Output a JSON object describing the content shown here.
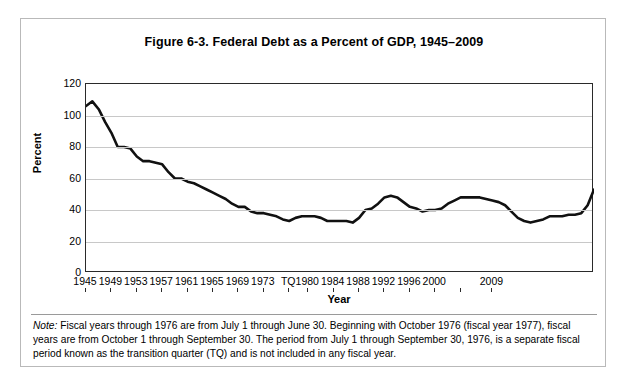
{
  "figure": {
    "title": "Figure 6-3. Federal Debt as a Percent of GDP, 1945–2009",
    "note_label": "Note:",
    "note_text": " Fiscal years through 1976 are from July 1 through June 30. Beginning with October 1976 (fiscal year 1977), fiscal years are from October 1 through September 30. The period from July 1 through September 30, 1976, is a separate fiscal period known as the transition quarter (TQ) and is not included in any fiscal year."
  },
  "colors": {
    "line": "#111111",
    "grid": "#c8c8c8",
    "axis": "#2a2a2a",
    "background": "#ffffff",
    "frame_border": "#b9b9b9"
  },
  "chart_data": {
    "type": "line",
    "title": "Figure 6-3. Federal Debt as a Percent of GDP, 1945–2009",
    "xlabel": "Year",
    "ylabel": "Percent",
    "ylim": [
      0,
      120
    ],
    "y_ticks": [
      0,
      20,
      40,
      60,
      80,
      100,
      120
    ],
    "grid": true,
    "legend": "none",
    "x_tick_labels": [
      "1945",
      "1949",
      "1953",
      "1957",
      "1961",
      "1965",
      "1969",
      "1973",
      "TQ",
      "1980",
      "1984",
      "1988",
      "1992",
      "1996",
      "2000",
      "",
      "2009"
    ],
    "x_tick_indices": [
      0,
      4,
      8,
      12,
      16,
      20,
      24,
      28,
      32,
      35,
      39,
      43,
      47,
      51,
      55,
      59,
      64
    ],
    "x": [
      "1945",
      "1946",
      "1947",
      "1948",
      "1949",
      "1950",
      "1951",
      "1952",
      "1953",
      "1954",
      "1955",
      "1956",
      "1957",
      "1958",
      "1959",
      "1960",
      "1961",
      "1962",
      "1963",
      "1964",
      "1965",
      "1966",
      "1967",
      "1968",
      "1969",
      "1970",
      "1971",
      "1972",
      "1973",
      "1974",
      "1975",
      "1976",
      "TQ",
      "1977",
      "1978",
      "1979",
      "1980",
      "1981",
      "1982",
      "1983",
      "1984",
      "1985",
      "1986",
      "1987",
      "1988",
      "1989",
      "1990",
      "1991",
      "1992",
      "1993",
      "1994",
      "1995",
      "1996",
      "1997",
      "1998",
      "1999",
      "2000",
      "2001",
      "2002",
      "2003",
      "2004",
      "2005",
      "2006",
      "2007",
      "2008",
      "2009"
    ],
    "values": [
      106.2,
      108.7,
      104.0,
      96.0,
      89.0,
      80.2,
      79.0,
      74.3,
      71.4,
      71.8,
      69.3,
      63.9,
      60.4,
      60.7,
      58.5,
      56.0,
      55.1,
      53.4,
      51.6,
      49.3,
      46.9,
      43.6,
      41.9,
      42.5,
      38.6,
      37.6,
      37.8,
      37.1,
      35.6,
      33.6,
      34.7,
      36.2,
      35.8,
      35.8,
      35.0,
      33.2,
      33.3,
      32.6,
      35.2,
      39.9,
      41.0,
      43.9,
      48.1,
      49.5,
      51.9,
      53.1,
      55.9,
      60.7,
      64.1,
      66.2,
      66.7,
      67.2,
      67.3,
      65.6,
      63.5,
      61.4,
      57.3,
      56.4,
      58.8,
      61.6,
      62.9,
      63.5,
      63.9,
      64.6,
      70.2,
      83.4
    ],
    "series_plot_values": [
      106,
      109,
      104,
      96,
      89,
      80,
      80,
      79,
      74,
      71,
      71,
      70,
      69,
      64,
      60,
      60,
      58,
      57,
      55,
      53,
      51,
      49,
      47,
      44,
      42,
      42,
      39,
      38,
      38,
      37,
      36,
      34,
      33,
      35,
      36,
      36,
      36,
      35,
      33,
      33,
      33,
      33,
      32,
      35,
      40,
      41,
      44,
      48,
      49,
      48,
      45,
      42,
      41,
      39,
      40,
      40,
      41,
      44,
      46,
      48,
      48,
      48,
      48,
      47,
      46,
      45,
      43,
      39,
      35,
      33,
      32,
      33,
      34,
      36,
      36,
      36,
      37,
      37,
      38,
      43,
      53
    ]
  },
  "axes": {
    "y_title": "Percent",
    "x_title": "Year"
  }
}
